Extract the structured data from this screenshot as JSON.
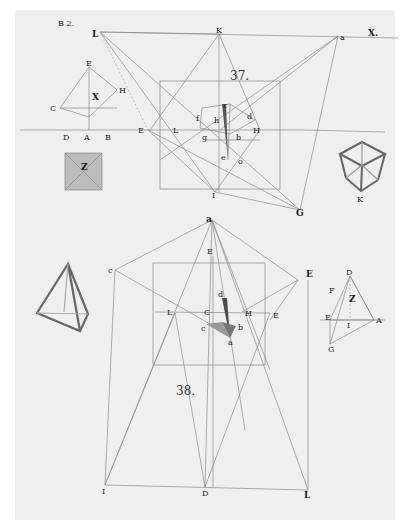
{
  "plate": {
    "plate_label": "B 2.",
    "plate_number": "X.",
    "figures": [
      {
        "number": "37.",
        "points": [
          "L",
          "K",
          "a",
          "E",
          "F",
          "H",
          "C",
          "D",
          "A",
          "B",
          "X",
          "Z",
          "I",
          "G",
          "c",
          "d",
          "e",
          "f",
          "g",
          "h",
          "b",
          "o"
        ]
      },
      {
        "number": "38.",
        "points": [
          "a",
          "c",
          "E",
          "C",
          "d",
          "L",
          "H",
          "E",
          "e",
          "b",
          "a",
          "I",
          "D",
          "L",
          "Z",
          "F",
          "G",
          "A"
        ]
      }
    ],
    "labels": {
      "B": "B",
      "L": "L",
      "K": "K",
      "a": "a",
      "E": "E",
      "H": "H",
      "X": "X",
      "C": "C",
      "D": "D",
      "A": "A",
      "Z": "Z",
      "I": "I",
      "G": "G",
      "c": "c",
      "d": "d",
      "e": "e",
      "f": "f",
      "g": "g",
      "h": "h",
      "b": "b",
      "o": "o",
      "F": "F",
      "cube_K": "K"
    }
  }
}
